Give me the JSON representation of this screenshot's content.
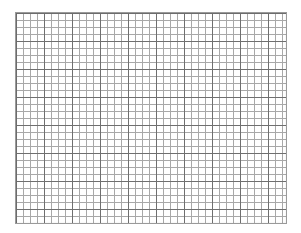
{
  "page": {
    "kind": "blank-graph-paper-scan",
    "background_color": "#ffffff",
    "width_px": 301,
    "height_px": 233
  },
  "title": {
    "text": "",
    "note_visible": false,
    "color": "#c9c9c9"
  },
  "grid": {
    "label": "graph paper grid",
    "left_px": 15,
    "top_px": 12,
    "width_px": 272,
    "height_px": 212,
    "minor_cell_px": 7,
    "major_every_n_cells": 4,
    "minor_columns": 38,
    "minor_rows": 30,
    "minor_line_color": "#a8a8a8",
    "major_line_color": "#6f6f6f",
    "border_color": "#9a9a9a",
    "fill_color": "#ffffff",
    "has_data": false,
    "has_axis_labels": false,
    "has_tick_labels": false
  }
}
